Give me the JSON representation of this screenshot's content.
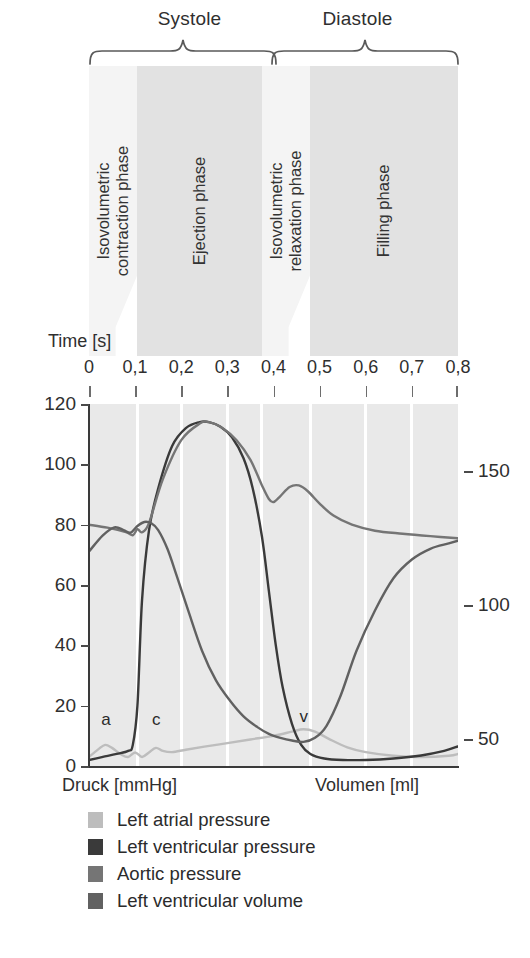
{
  "figure": {
    "groups": [
      {
        "label": "Systole",
        "start": 0.0,
        "end": 0.4
      },
      {
        "label": "Diastole",
        "start": 0.4,
        "end": 0.8
      }
    ],
    "phases": [
      {
        "label_lines": [
          "Isovolumetric",
          "contraction phase"
        ],
        "start": 0.0,
        "end": 0.105,
        "shade": "light"
      },
      {
        "label_lines": [
          "Ejection phase"
        ],
        "start": 0.105,
        "end": 0.375,
        "shade": "dark"
      },
      {
        "label_lines": [
          "Isovolumetric",
          "relaxation phase"
        ],
        "start": 0.375,
        "end": 0.48,
        "shade": "light"
      },
      {
        "label_lines": [
          "Filling phase"
        ],
        "start": 0.48,
        "end": 0.8,
        "shade": "dark"
      }
    ],
    "time_axis": {
      "title": "Time [s]",
      "ticks": [
        "0",
        "0,1",
        "0,2",
        "0,3",
        "0,4",
        "0,5",
        "0,6",
        "0,7",
        "0,8"
      ],
      "tick_values": [
        0,
        0.1,
        0.2,
        0.3,
        0.4,
        0.5,
        0.6,
        0.7,
        0.8
      ]
    },
    "left_axis": {
      "caption": "Druck [mmHg]",
      "ticks": [
        "0",
        "20",
        "40",
        "60",
        "80",
        "100",
        "120"
      ],
      "tick_values": [
        0,
        20,
        40,
        60,
        80,
        100,
        120
      ],
      "min": 0,
      "max": 120
    },
    "right_axis": {
      "caption": "Volumen [ml]",
      "ticks": [
        "50",
        "100",
        "150"
      ],
      "tick_values": [
        50,
        100,
        150
      ],
      "min": 40,
      "max": 175
    },
    "wave_marks": [
      {
        "label": "a",
        "t": 0.035,
        "p": 12
      },
      {
        "label": "c",
        "t": 0.145,
        "p": 12
      },
      {
        "label": "v",
        "t": 0.465,
        "p": 13
      }
    ],
    "legend": [
      {
        "label": "Left atrial pressure",
        "color": "#bdbdbd"
      },
      {
        "label": "Left ventricular pressure",
        "color": "#3a3a3a"
      },
      {
        "label": "Aortic pressure",
        "color": "#757575"
      },
      {
        "label": "Left ventricular volume",
        "color": "#616161"
      }
    ],
    "colors": {
      "band_light": "#f4f4f4",
      "band_dark": "#e2e2e2",
      "plot_bg": "#e9e9e9",
      "gridline": "#ffffff",
      "axis": "#3a3a3a",
      "text": "#2b2b2b"
    }
  },
  "chart_data": {
    "type": "line",
    "title": "",
    "xlabel": "Time [s]",
    "ylabel": "Druck [mmHg]",
    "y2label": "Volumen [ml]",
    "xlim": [
      0,
      0.8
    ],
    "ylim": [
      0,
      120
    ],
    "y2lim": [
      40,
      175
    ],
    "grid": true,
    "legend_position": "bottom",
    "series": [
      {
        "name": "Left atrial pressure",
        "axis": "left",
        "color": "#bdbdbd",
        "x": [
          0.0,
          0.02,
          0.035,
          0.05,
          0.07,
          0.085,
          0.1,
          0.115,
          0.13,
          0.145,
          0.16,
          0.18,
          0.21,
          0.25,
          0.3,
          0.35,
          0.4,
          0.44,
          0.465,
          0.49,
          0.52,
          0.56,
          0.6,
          0.66,
          0.72,
          0.78,
          0.8
        ],
        "values": [
          3.0,
          5.5,
          7.0,
          6.0,
          3.8,
          3.0,
          4.5,
          3.0,
          4.5,
          6.0,
          5.0,
          4.6,
          5.4,
          6.4,
          7.6,
          8.8,
          10.0,
          11.4,
          12.2,
          11.4,
          9.0,
          6.2,
          4.6,
          3.4,
          3.0,
          3.4,
          4.0
        ]
      },
      {
        "name": "Left ventricular pressure",
        "axis": "left",
        "color": "#3a3a3a",
        "x": [
          0.0,
          0.03,
          0.06,
          0.085,
          0.095,
          0.105,
          0.115,
          0.13,
          0.15,
          0.18,
          0.21,
          0.24,
          0.26,
          0.285,
          0.31,
          0.335,
          0.355,
          0.375,
          0.39,
          0.405,
          0.42,
          0.44,
          0.46,
          0.48,
          0.51,
          0.55,
          0.6,
          0.66,
          0.72,
          0.77,
          0.8
        ],
        "values": [
          2.0,
          3.0,
          4.0,
          5.0,
          7.0,
          20.0,
          55.0,
          78.0,
          92.0,
          106.0,
          112.0,
          114.0,
          114.0,
          112.5,
          109.0,
          102.0,
          92.0,
          76.0,
          58.0,
          40.0,
          26.0,
          14.0,
          7.0,
          4.0,
          2.5,
          2.0,
          2.0,
          2.5,
          3.5,
          5.0,
          6.5
        ]
      },
      {
        "name": "Aortic pressure",
        "axis": "left",
        "color": "#757575",
        "x": [
          0.0,
          0.04,
          0.08,
          0.095,
          0.105,
          0.115,
          0.13,
          0.16,
          0.2,
          0.24,
          0.26,
          0.29,
          0.32,
          0.35,
          0.375,
          0.39,
          0.4,
          0.415,
          0.435,
          0.455,
          0.475,
          0.5,
          0.53,
          0.57,
          0.62,
          0.68,
          0.74,
          0.8
        ],
        "values": [
          80.0,
          79.0,
          77.5,
          76.5,
          78.5,
          77.5,
          80.5,
          95.0,
          108.0,
          113.5,
          114.0,
          112.0,
          108.0,
          101.5,
          93.0,
          88.5,
          87.5,
          89.5,
          92.5,
          93.0,
          91.0,
          87.0,
          83.0,
          80.0,
          78.0,
          77.0,
          76.2,
          75.5
        ]
      },
      {
        "name": "Left ventricular volume",
        "axis": "right",
        "color": "#616161",
        "x": [
          0.0,
          0.03,
          0.055,
          0.075,
          0.09,
          0.105,
          0.12,
          0.135,
          0.15,
          0.17,
          0.19,
          0.215,
          0.245,
          0.275,
          0.305,
          0.335,
          0.365,
          0.39,
          0.415,
          0.44,
          0.465,
          0.49,
          0.515,
          0.545,
          0.58,
          0.62,
          0.66,
          0.7,
          0.74,
          0.78,
          0.8
        ],
        "values": [
          120.0,
          126.0,
          129.0,
          128.0,
          127.0,
          129.5,
          131.0,
          130.5,
          128.0,
          121.0,
          111.0,
          98.0,
          83.0,
          72.0,
          64.5,
          58.5,
          54.5,
          52.0,
          50.5,
          49.5,
          49.0,
          50.5,
          55.0,
          66.0,
          83.0,
          98.0,
          110.0,
          117.0,
          121.0,
          123.0,
          124.0
        ]
      }
    ]
  }
}
